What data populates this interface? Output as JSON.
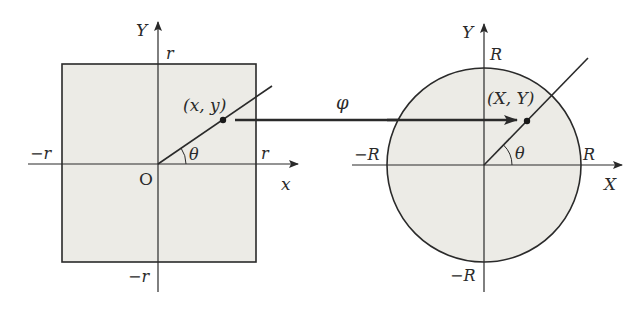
{
  "colors": {
    "background": "#ffffff",
    "fill": "#ecebe6",
    "stroke": "#2a2a2a"
  },
  "left_figure": {
    "shape": "square",
    "axis_labels": {
      "horizontal": "x",
      "vertical": "Y"
    },
    "origin_label": "O",
    "ticks": {
      "right": "r",
      "left": "−r",
      "top": "r",
      "bottom": "−r"
    },
    "point_label": "(x, y)",
    "angle_label": "θ"
  },
  "mapping": {
    "label": "φ"
  },
  "right_figure": {
    "shape": "circle",
    "axis_labels": {
      "horizontal": "X",
      "vertical": "Y"
    },
    "ticks": {
      "right": "R",
      "left": "−R",
      "top": "R",
      "bottom": "−R"
    },
    "point_label": "(X, Y)",
    "angle_label": "θ"
  }
}
